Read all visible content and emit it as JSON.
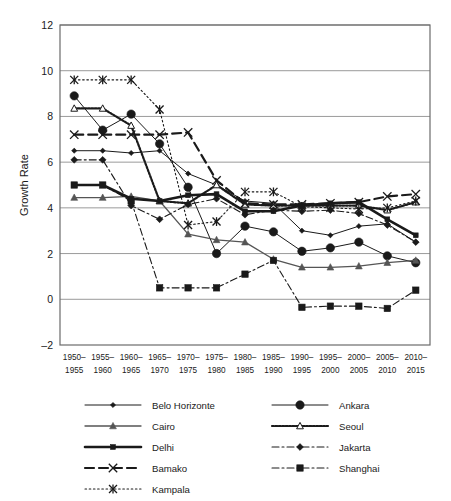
{
  "chart_data": {
    "type": "line",
    "title": "",
    "xlabel": "",
    "ylabel": "Growth Rate",
    "ylim": [
      -2,
      12
    ],
    "yticks": [
      -2,
      0,
      2,
      4,
      6,
      8,
      10,
      12
    ],
    "grid": true,
    "legend_position": "bottom",
    "categories": [
      "1950-1955",
      "1955-1960",
      "1960-1965",
      "1965-1970",
      "1970-1975",
      "1975-1980",
      "1980-1985",
      "1985-1990",
      "1990-1995",
      "1995-2000",
      "2000-2005",
      "2005-2010",
      "2010-2015"
    ],
    "category_lines": [
      [
        "1950-",
        "1955"
      ],
      [
        "1955-",
        "1960"
      ],
      [
        "1960-",
        "1965"
      ],
      [
        "1965-",
        "1970"
      ],
      [
        "1970-",
        "1975"
      ],
      [
        "1975-",
        "1980"
      ],
      [
        "1980-",
        "1985"
      ],
      [
        "1985-",
        "1990"
      ],
      [
        "1990-",
        "1995"
      ],
      [
        "1995-",
        "2000"
      ],
      [
        "2000-",
        "2005"
      ],
      [
        "2005-",
        "2010"
      ],
      [
        "2010-",
        "2015"
      ]
    ],
    "series": [
      {
        "name": "Belo Horizonte",
        "marker": "diamond-small",
        "line_style": "solid-thin",
        "color": "#1a1a1a",
        "values": [
          6.5,
          6.5,
          6.4,
          6.5,
          5.5,
          5.0,
          4.3,
          4.2,
          3.0,
          2.8,
          3.2,
          3.3,
          2.5
        ]
      },
      {
        "name": "Ankara",
        "marker": "circle-large",
        "line_style": "solid-thin",
        "color": "#1a1a1a",
        "values": [
          8.9,
          7.4,
          8.1,
          6.8,
          4.9,
          2.0,
          3.2,
          2.95,
          2.1,
          2.25,
          2.5,
          1.9,
          1.6
        ]
      },
      {
        "name": "Cairo",
        "marker": "triangle-up",
        "line_style": "solid-gray",
        "color": "#555555",
        "values": [
          4.45,
          4.45,
          4.5,
          4.3,
          2.85,
          2.6,
          2.5,
          1.75,
          1.4,
          1.4,
          1.45,
          1.6,
          1.7
        ]
      },
      {
        "name": "Seoul",
        "marker": "triangle-open",
        "line_style": "squiggle",
        "color": "#1a1a1a",
        "values": [
          8.35,
          8.35,
          7.6,
          4.3,
          4.2,
          5.0,
          4.15,
          4.1,
          4.1,
          4.1,
          4.1,
          3.9,
          4.25
        ]
      },
      {
        "name": "Delhi",
        "marker": "square-small",
        "line_style": "solid-thick",
        "color": "#1a1a1a",
        "values": [
          5.0,
          5.0,
          4.4,
          4.3,
          4.55,
          4.6,
          3.85,
          3.85,
          4.1,
          4.2,
          4.25,
          3.5,
          2.8
        ]
      },
      {
        "name": "Jakarta",
        "marker": "diamond-solid",
        "line_style": "dash-dot",
        "color": "#1a1a1a",
        "values": [
          6.1,
          6.1,
          4.1,
          3.5,
          4.15,
          4.4,
          3.7,
          3.9,
          3.85,
          3.9,
          3.75,
          3.25,
          2.5
        ]
      },
      {
        "name": "Bamako",
        "marker": "cross-x",
        "line_style": "dashed-thick",
        "color": "#1a1a1a",
        "values": [
          7.2,
          7.2,
          7.2,
          7.2,
          7.3,
          5.2,
          4.2,
          4.15,
          4.15,
          4.2,
          4.25,
          4.5,
          4.6
        ]
      },
      {
        "name": "Shanghai",
        "marker": "square-solid",
        "line_style": "dash-dot",
        "color": "#1a1a1a",
        "values": [
          5.0,
          5.0,
          4.3,
          0.5,
          0.5,
          0.5,
          1.1,
          1.7,
          -0.35,
          -0.3,
          -0.3,
          -0.4,
          0.4
        ]
      },
      {
        "name": "Kampala",
        "marker": "star-x",
        "line_style": "dotted",
        "color": "#1a1a1a",
        "values": [
          9.6,
          9.6,
          9.6,
          8.3,
          3.25,
          3.4,
          4.7,
          4.7,
          4.05,
          4.0,
          3.95,
          4.0,
          4.3
        ]
      }
    ]
  },
  "legend": {
    "columns": [
      [
        {
          "label": "Belo Horizonte",
          "key": "belo-horizonte"
        },
        {
          "label": "Cairo",
          "key": "cairo"
        },
        {
          "label": "Delhi",
          "key": "delhi"
        },
        {
          "label": "Bamako",
          "key": "bamako"
        },
        {
          "label": "Kampala",
          "key": "kampala"
        }
      ],
      [
        {
          "label": "Ankara",
          "key": "ankara"
        },
        {
          "label": "Seoul",
          "key": "seoul"
        },
        {
          "label": "Jakarta",
          "key": "jakarta"
        },
        {
          "label": "Shanghai",
          "key": "shanghai"
        }
      ]
    ]
  },
  "axes": {
    "y_label": "Growth Rate",
    "y_ticks": [
      "12",
      "10",
      "8",
      "6",
      "4",
      "2",
      "0",
      "-2"
    ]
  },
  "colors": {
    "line": "#1a1a1a",
    "gray_line": "#555555",
    "grid": "#9a9a9a",
    "axis": "#6b6b6b",
    "background": "#ffffff"
  }
}
